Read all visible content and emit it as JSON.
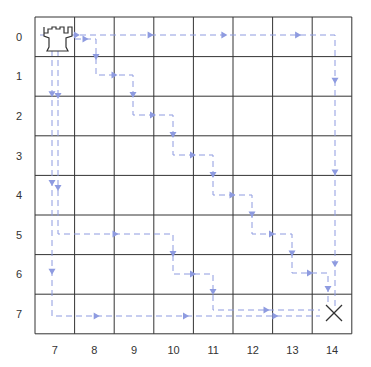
{
  "board": {
    "cols": 8,
    "rows": 8,
    "row_labels": [
      "0",
      "1",
      "2",
      "3",
      "4",
      "5",
      "6",
      "7"
    ],
    "col_labels": [
      "7",
      "8",
      "9",
      "10",
      "11",
      "12",
      "13",
      "14"
    ],
    "start_piece": "rook-icon",
    "start_cell": [
      0,
      0
    ],
    "target_marker": "x-icon",
    "target_cell": [
      7,
      7
    ],
    "path_color": "#8e9be0",
    "grid_color": "#333333"
  },
  "paths": [
    {
      "name": "top-right-path",
      "points": [
        [
          40,
          35
        ],
        [
          335,
          35
        ],
        [
          335,
          310
        ]
      ]
    },
    {
      "name": "left-down-then-right-path",
      "points": [
        [
          52,
          50
        ],
        [
          52,
          316
        ],
        [
          320,
          316
        ]
      ]
    },
    {
      "name": "left-staircase-path",
      "points": [
        [
          58,
          50
        ],
        [
          58,
          234
        ],
        [
          173,
          234
        ],
        [
          173,
          274
        ],
        [
          213,
          274
        ],
        [
          213,
          310
        ],
        [
          320,
          310
        ]
      ]
    },
    {
      "name": "diagonal-staircase-path",
      "points": [
        [
          75,
          39
        ],
        [
          96,
          39
        ],
        [
          96,
          75
        ],
        [
          133,
          75
        ],
        [
          133,
          115
        ],
        [
          173,
          115
        ],
        [
          173,
          155
        ],
        [
          213,
          155
        ],
        [
          213,
          195
        ],
        [
          252,
          195
        ],
        [
          252,
          234
        ],
        [
          292,
          234
        ],
        [
          292,
          273
        ],
        [
          328,
          273
        ],
        [
          328,
          305
        ]
      ]
    }
  ]
}
